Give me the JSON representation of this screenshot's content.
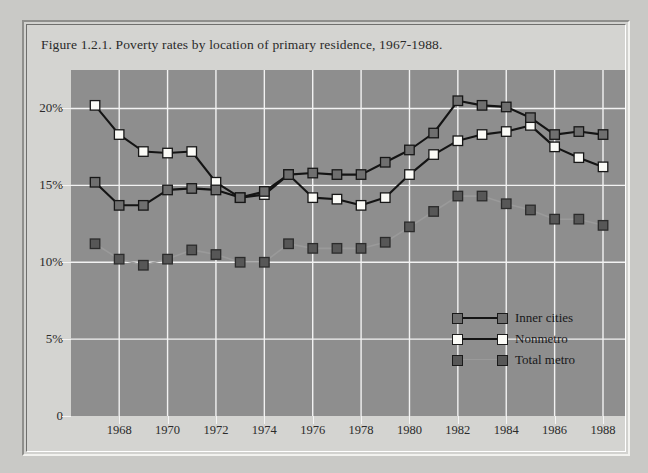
{
  "figure": {
    "title": "Figure 1.2.1. Poverty rates by location of primary residence, 1967-1988."
  },
  "axes": {
    "y_ticks": [
      "20%",
      "15%",
      "10%",
      "5%",
      "0"
    ],
    "x_ticks": [
      "1968",
      "1970",
      "1972",
      "1974",
      "1976",
      "1978",
      "1980",
      "1982",
      "1984",
      "1986",
      "1988"
    ]
  },
  "legend": {
    "items": [
      {
        "label": "Inner cities",
        "marker_fill": "#6f6f6f",
        "line": "#141414"
      },
      {
        "label": "Nonmetro",
        "marker_fill": "#fbfbf7",
        "line": "#141414"
      },
      {
        "label": "Total metro",
        "marker_fill": "#575757",
        "line": "#9a9a9a"
      }
    ]
  },
  "chart_data": {
    "type": "line",
    "title": "Figure 1.2.1. Poverty rates by location of primary residence, 1967-1988.",
    "xlabel": "",
    "ylabel": "",
    "ylim": [
      0,
      22.5
    ],
    "xlim": [
      1967,
      1988
    ],
    "yticks": [
      0,
      5,
      10,
      15,
      20
    ],
    "ytick_labels": [
      "0",
      "5%",
      "10%",
      "15%",
      "20%"
    ],
    "xticks": [
      1968,
      1970,
      1972,
      1974,
      1976,
      1978,
      1980,
      1982,
      1984,
      1986,
      1988
    ],
    "grid": true,
    "legend_position": "inside-lower-right",
    "plot_background": "#8e8e8e",
    "x": [
      1967,
      1968,
      1969,
      1970,
      1971,
      1972,
      1973,
      1974,
      1975,
      1976,
      1977,
      1978,
      1979,
      1980,
      1981,
      1982,
      1983,
      1984,
      1985,
      1986,
      1987,
      1988
    ],
    "series": [
      {
        "name": "Inner cities",
        "marker": "square",
        "marker_fill": "#6f6f6f",
        "line_color": "#141414",
        "values": [
          15.2,
          13.7,
          13.7,
          14.7,
          14.8,
          14.7,
          14.2,
          14.6,
          15.7,
          15.8,
          15.7,
          15.7,
          16.5,
          17.3,
          18.4,
          20.5,
          20.2,
          20.1,
          19.4,
          18.3,
          18.5,
          18.3
        ]
      },
      {
        "name": "Nonmetro",
        "marker": "square",
        "marker_fill": "#fbfbf7",
        "line_color": "#141414",
        "values": [
          20.2,
          18.3,
          17.2,
          17.1,
          17.2,
          15.2,
          14.2,
          14.4,
          15.7,
          14.2,
          14.1,
          13.7,
          14.2,
          15.7,
          17.0,
          17.9,
          18.3,
          18.5,
          18.9,
          17.5,
          16.8,
          16.2
        ]
      },
      {
        "name": "Total metro",
        "marker": "square",
        "marker_fill": "#575757",
        "line_color": "#9a9a9a",
        "values": [
          11.2,
          10.2,
          9.8,
          10.2,
          10.8,
          10.5,
          10.0,
          10.0,
          11.2,
          10.9,
          10.9,
          10.9,
          11.3,
          12.3,
          13.3,
          14.3,
          14.3,
          13.8,
          13.4,
          12.8,
          12.8,
          12.4
        ]
      }
    ]
  }
}
